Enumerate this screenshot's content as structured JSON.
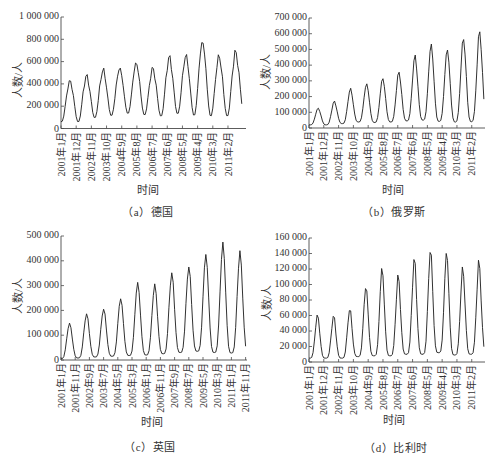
{
  "chart_data": [
    {
      "panel": "a",
      "type": "line",
      "caption": "（a）德国",
      "country": "德国",
      "xlabel": "时间",
      "ylabel": "人数/人",
      "frequency": "monthly",
      "x_range": [
        "2001年1月",
        "2011年12月"
      ],
      "n_months": 132,
      "xtick_labels": [
        "2001年1月",
        "2001年12月",
        "2002年11月",
        "2003年10月",
        "2004年9月",
        "2005年8月",
        "2006年7月",
        "2007年6月",
        "2008年5月",
        "2009年4月",
        "2010年3月",
        "2011年2月"
      ],
      "xtick_step_months": 11,
      "ylim": [
        0,
        1000000
      ],
      "yticks": [
        0,
        200000,
        400000,
        600000,
        800000,
        1000000
      ],
      "ytick_labels": [
        "0",
        "200 000",
        "400 000",
        "600 000",
        "800 000",
        "1 000 000"
      ],
      "grid": false,
      "legend": null,
      "series": [
        {
          "name": "德国",
          "color": "#262626",
          "years": [
            2001,
            2002,
            2003,
            2004,
            2005,
            2006,
            2007,
            2008,
            2009,
            2010,
            2011
          ],
          "start_value": 60000,
          "annual_peaks": [
            423000,
            468000,
            522000,
            538000,
            583000,
            535000,
            634000,
            649000,
            775000,
            643000,
            679000
          ],
          "annual_troughs": [
            56000,
            93000,
            112000,
            131000,
            118000,
            106000,
            128000,
            112000,
            106000,
            106000,
            150000
          ],
          "peak_month_index": 6.5,
          "shape_exponent": 1.0,
          "texture": 0.08
        }
      ]
    },
    {
      "panel": "b",
      "type": "line",
      "caption": "（b）俄罗斯",
      "country": "俄罗斯",
      "xlabel": "时间",
      "ylabel": "人数/人",
      "frequency": "monthly",
      "x_range": [
        "2001年1月",
        "2011年12月"
      ],
      "n_months": 132,
      "xtick_labels": [
        "2001年1月",
        "2001年12月",
        "2002年11月",
        "2003年10月",
        "2004年9月",
        "2005年8月",
        "2006年7月",
        "2007年6月",
        "2008年5月",
        "2009年4月",
        "2010年3月",
        "2011年2月"
      ],
      "xtick_step_months": 11,
      "ylim": [
        0,
        700000
      ],
      "yticks": [
        0,
        100000,
        200000,
        300000,
        400000,
        500000,
        600000,
        700000
      ],
      "ytick_labels": [
        "0",
        "100 000",
        "200 000",
        "300 000",
        "400 000",
        "500 000",
        "600 000",
        "700 000"
      ],
      "grid": false,
      "legend": null,
      "series": [
        {
          "name": "俄罗斯",
          "color": "#262626",
          "years": [
            2001,
            2002,
            2003,
            2004,
            2005,
            2006,
            2007,
            2008,
            2009,
            2010,
            2011
          ],
          "start_value": 20000,
          "annual_peaks": [
            125000,
            168000,
            247000,
            279000,
            315000,
            353000,
            455000,
            526000,
            498000,
            568000,
            609000
          ],
          "annual_troughs": [
            20000,
            28000,
            38000,
            35000,
            38000,
            45000,
            50000,
            42000,
            38000,
            40000,
            50000
          ],
          "peak_month_index": 6.8,
          "shape_exponent": 1.8,
          "texture": 0.04
        }
      ]
    },
    {
      "panel": "c",
      "type": "line",
      "caption": "（c）英国",
      "country": "英国",
      "xlabel": "时间",
      "ylabel": "人数/人",
      "frequency": "monthly",
      "x_range": [
        "2001年1月",
        "2011年12月"
      ],
      "n_months": 132,
      "xtick_labels": [
        "2001年1月",
        "2001年11月",
        "2002年9月",
        "2003年7月",
        "2004年5月",
        "2005年3月",
        "2006年1月",
        "2006年11月",
        "2007年9月",
        "2008年7月",
        "2009年5月",
        "2010年3月",
        "2011年1月",
        "2011年11月"
      ],
      "xtick_step_months": 10,
      "ylim": [
        0,
        500000
      ],
      "yticks": [
        0,
        100000,
        200000,
        300000,
        400000,
        500000
      ],
      "ytick_labels": [
        "0",
        "100 000",
        "200 000",
        "300 000",
        "400 000",
        "500 000"
      ],
      "grid": false,
      "legend": null,
      "series": [
        {
          "name": "英国",
          "color": "#262626",
          "years": [
            2001,
            2002,
            2003,
            2004,
            2005,
            2006,
            2007,
            2008,
            2009,
            2010,
            2011
          ],
          "start_value": 5000,
          "annual_peaks": [
            147000,
            185000,
            206000,
            248000,
            310000,
            302000,
            349000,
            376000,
            424000,
            467000,
            432000
          ],
          "annual_troughs": [
            8000,
            12000,
            15000,
            18000,
            20000,
            25000,
            30000,
            35000,
            30000,
            28000,
            30000
          ],
          "peak_month_index": 6.0,
          "shape_exponent": 2.0,
          "texture": 0.03
        }
      ]
    },
    {
      "panel": "d",
      "type": "line",
      "caption": "（d）比利时",
      "country": "比利时",
      "xlabel": "时间",
      "ylabel": "人数/人",
      "frequency": "monthly",
      "x_range": [
        "2001年1月",
        "2011年12月"
      ],
      "n_months": 132,
      "xtick_labels": [
        "2001年1月",
        "2001年12月",
        "2002年11月",
        "2003年10月",
        "2004年9月",
        "2005年8月",
        "2006年7月",
        "2007年6月",
        "2008年5月",
        "2009年4月",
        "2010年3月",
        "2011年2月"
      ],
      "xtick_step_months": 11,
      "ylim": [
        0,
        160000
      ],
      "yticks": [
        0,
        20000,
        40000,
        60000,
        80000,
        100000,
        120000,
        140000,
        160000
      ],
      "ytick_labels": [
        "0",
        "20 000",
        "40 000",
        "60 000",
        "80 000",
        "100 000",
        "120 000",
        "140 000",
        "160 000"
      ],
      "grid": false,
      "legend": null,
      "series": [
        {
          "name": "比利时",
          "color": "#262626",
          "years": [
            2001,
            2002,
            2003,
            2004,
            2005,
            2006,
            2007,
            2008,
            2009,
            2010,
            2011
          ],
          "start_value": 5000,
          "annual_peaks": [
            60000,
            59000,
            68000,
            97000,
            120000,
            110000,
            132000,
            144000,
            141000,
            120000,
            128000
          ],
          "annual_troughs": [
            5000,
            5000,
            7000,
            8000,
            8000,
            10000,
            10000,
            12000,
            9000,
            10000,
            12000
          ],
          "peak_month_index": 6.3,
          "shape_exponent": 2.4,
          "texture": 0.06
        }
      ]
    }
  ]
}
